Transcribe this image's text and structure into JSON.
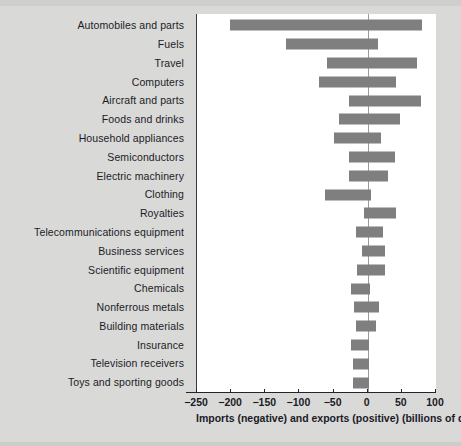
{
  "chart_data": {
    "type": "bar",
    "orientation": "horizontal",
    "title": "",
    "subtitle": "",
    "xlabel": "Imports (negative) and exports (positive) (billions of dollars)",
    "ylabel": "",
    "xlim": [
      -250,
      100
    ],
    "xticks": [
      -250,
      -200,
      -150,
      -100,
      -50,
      0,
      50,
      100
    ],
    "xticklabels": [
      "−250",
      "−200",
      "−150",
      "−100",
      "−50",
      "0",
      "50",
      "100"
    ],
    "grid": false,
    "legend": null,
    "bar_color": "#7f7f7f",
    "categories": [
      "Automobiles and parts",
      "Fuels",
      "Travel",
      "Computers",
      "Aircraft and parts",
      "Foods and drinks",
      "Household appliances",
      "Semiconductors",
      "Electric machinery",
      "Clothing",
      "Royalties",
      "Telecommunications equipment",
      "Business services",
      "Scientific equipment",
      "Chemicals",
      "Nonferrous metals",
      "Building materials",
      "Insurance",
      "Television receivers",
      "Toys and sporting goods"
    ],
    "imports": [
      -202,
      -120,
      -60,
      -72,
      -27,
      -42,
      -50,
      -27,
      -28,
      -62,
      -5,
      -17,
      -9,
      -15,
      -25,
      -20,
      -17,
      -25,
      -22,
      -22
    ],
    "exports": [
      80,
      15,
      72,
      42,
      78,
      48,
      20,
      40,
      30,
      5,
      42,
      22,
      25,
      25,
      4,
      16,
      12,
      2,
      2,
      2
    ]
  },
  "axis": {
    "x_title": "Imports (negative) and exports (positive) (billions of dollars)"
  }
}
